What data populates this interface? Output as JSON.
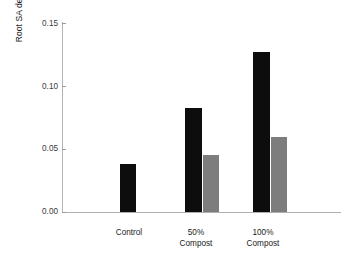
{
  "chart_data": {
    "type": "bar",
    "title": "",
    "subtitle": "",
    "xlabel": "",
    "ylabel": "Root SA density (cm2 cm-3)",
    "ylabel_parts": {
      "prefix": "Root SA density (cm",
      "sup1": "2",
      "mid": " cm",
      "sup2": "−3",
      "suffix": ")"
    },
    "categories": [
      "Control",
      "50% Compost",
      "100% Compost"
    ],
    "category_lines": [
      [
        "Control"
      ],
      [
        "50%",
        "Compost"
      ],
      [
        "100%",
        "Compost"
      ]
    ],
    "series": [
      {
        "name": "black",
        "color": "#0d0d0d",
        "values": [
          0.038,
          0.082,
          0.126
        ]
      },
      {
        "name": "gray",
        "color": "#7d7d7d",
        "values": [
          null,
          0.045,
          0.059
        ]
      }
    ],
    "ylim": [
      0.0,
      0.15
    ],
    "yticks": [
      0.0,
      0.05,
      0.1,
      0.15
    ],
    "ytick_labels": [
      "0.00",
      "0.05",
      "0.10",
      "0.15"
    ],
    "grid": false,
    "legend": "none",
    "axis_color": "#b0b0b0",
    "background": "#ffffff"
  },
  "bar_geometry": {
    "black": [
      {
        "left": 120,
        "width": 16
      },
      {
        "left": 185,
        "width": 17
      },
      {
        "left": 253,
        "width": 17
      }
    ],
    "gray": [
      null,
      {
        "left": 203,
        "width": 16
      },
      {
        "left": 271,
        "width": 16
      }
    ]
  },
  "axis_geometry": {
    "plot_left": 62,
    "plot_top": 22,
    "baseline_y": 212,
    "plot_right": 341,
    "ytick_y": [
      211.5,
      148.8,
      86.1,
      23.4
    ],
    "xtick_label_x": [
      94,
      161,
      228
    ]
  }
}
